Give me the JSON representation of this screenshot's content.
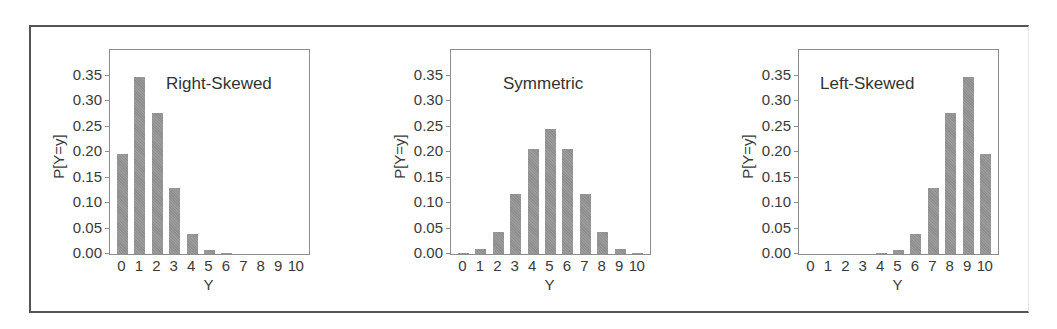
{
  "chart_data": [
    {
      "type": "bar",
      "title": "Right-Skewed",
      "xlabel": "Y",
      "ylabel": "P[Y=y]",
      "categories": [
        "0",
        "1",
        "2",
        "3",
        "4",
        "5",
        "6",
        "7",
        "8",
        "9",
        "10"
      ],
      "values": [
        0.197,
        0.347,
        0.276,
        0.13,
        0.04,
        0.008,
        0.001,
        0.0,
        0.0,
        0.0,
        0.0
      ],
      "yticks": [
        "0.00",
        "0.05",
        "0.10",
        "0.15",
        "0.20",
        "0.25",
        "0.30",
        "0.35"
      ],
      "ylim": [
        0,
        0.4
      ],
      "grid": false,
      "bar_color": "#8e8e8e"
    },
    {
      "type": "bar",
      "title": "Symmetric",
      "xlabel": "Y",
      "ylabel": "P[Y=y]",
      "categories": [
        "0",
        "1",
        "2",
        "3",
        "4",
        "5",
        "6",
        "7",
        "8",
        "9",
        "10"
      ],
      "values": [
        0.001,
        0.01,
        0.044,
        0.117,
        0.205,
        0.246,
        0.205,
        0.117,
        0.044,
        0.01,
        0.001
      ],
      "yticks": [
        "0.00",
        "0.05",
        "0.10",
        "0.15",
        "0.20",
        "0.25",
        "0.30",
        "0.35"
      ],
      "ylim": [
        0,
        0.4
      ],
      "grid": false,
      "bar_color": "#8e8e8e"
    },
    {
      "type": "bar",
      "title": "Left-Skewed",
      "xlabel": "Y",
      "ylabel": "P[Y=y]",
      "categories": [
        "0",
        "1",
        "2",
        "3",
        "4",
        "5",
        "6",
        "7",
        "8",
        "9",
        "10"
      ],
      "values": [
        0.0,
        0.0,
        0.0,
        0.0,
        0.001,
        0.008,
        0.04,
        0.13,
        0.276,
        0.347,
        0.197
      ],
      "yticks": [
        "0.00",
        "0.05",
        "0.10",
        "0.15",
        "0.20",
        "0.25",
        "0.30",
        "0.35"
      ],
      "ylim": [
        0,
        0.4
      ],
      "grid": false,
      "bar_color": "#8e8e8e"
    }
  ],
  "layout": {
    "panels": [
      {
        "plot_left": 109,
        "title_left": 166
      },
      {
        "plot_left": 450,
        "title_left": 503
      },
      {
        "plot_left": 798,
        "title_left": 820
      }
    ]
  }
}
